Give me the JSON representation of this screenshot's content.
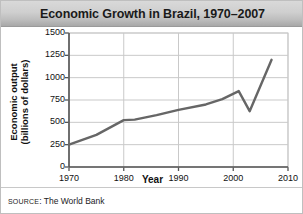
{
  "figure": {
    "title": "Economic Growth in Brazil, 1970–2007",
    "source_prefix": "SOURCE",
    "source_separator": ": ",
    "source_value": "The World Bank"
  },
  "chart_data": {
    "type": "line",
    "title": "Economic Growth in Brazil, 1970–2007",
    "xlabel": "Year",
    "ylabel": "Economic output\n(billions of dollars)",
    "ylabel_line1": "Economic output",
    "ylabel_line2": "(billions of dollars)",
    "xlim": [
      1970,
      2010
    ],
    "ylim": [
      0,
      1500
    ],
    "xticks": [
      1970,
      1980,
      1990,
      2000,
      2010
    ],
    "yticks": [
      0,
      250,
      500,
      750,
      1000,
      1250,
      1500
    ],
    "grid": true,
    "legend": "none",
    "line_color": "#666666",
    "grid_color": "#c9c9c9",
    "axis_color": "#555555",
    "series": [
      {
        "name": "Economic output",
        "x": [
          1970,
          1975,
          1980,
          1982,
          1986,
          1990,
          1995,
          1998,
          2001,
          2003,
          2007
        ],
        "values": [
          250,
          360,
          525,
          530,
          580,
          640,
          700,
          760,
          850,
          625,
          1200
        ]
      }
    ]
  }
}
